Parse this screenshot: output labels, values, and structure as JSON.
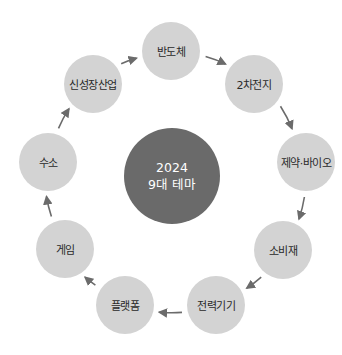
{
  "diagram": {
    "type": "cycle",
    "center": {
      "line1": "2024",
      "line2": "9대 테마",
      "x": 172,
      "y": 176,
      "r": 48,
      "color": "#6a6a6a"
    },
    "node_color": "#d3d3d3",
    "arrow_color": "#6b6b6b",
    "node_radius": 29,
    "nodes": [
      {
        "label": "반도체",
        "x": 171,
        "y": 51
      },
      {
        "label": "2차전지",
        "x": 254,
        "y": 84
      },
      {
        "label": "제약·바이오",
        "x": 306,
        "y": 162
      },
      {
        "label": "소비재",
        "x": 283,
        "y": 250
      },
      {
        "label": "전력기기",
        "x": 216,
        "y": 305
      },
      {
        "label": "플랫폼",
        "x": 125,
        "y": 305
      },
      {
        "label": "게임",
        "x": 65,
        "y": 249
      },
      {
        "label": "수소",
        "x": 48,
        "y": 162
      },
      {
        "label": "신성장산업",
        "x": 93,
        "y": 84
      }
    ]
  }
}
